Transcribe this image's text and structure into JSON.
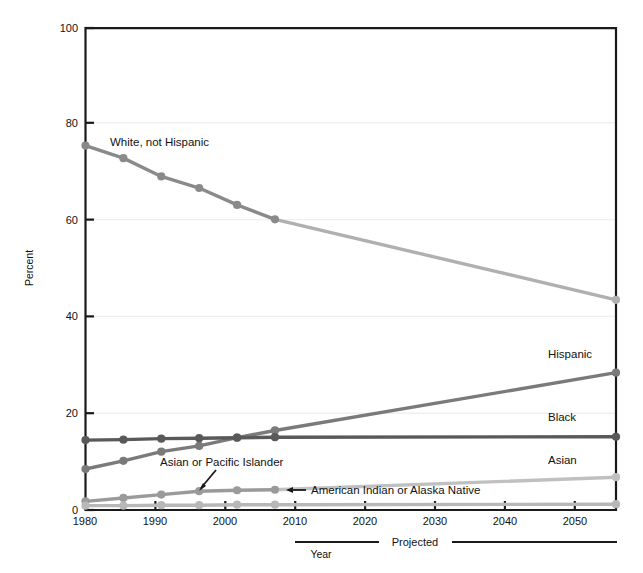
{
  "figure": {
    "title_cropped": "",
    "ylabel": "Percent",
    "xlabel": "Year",
    "projected_label": "Projected"
  },
  "axes": {
    "y_ticks": [
      "0",
      "20",
      "40",
      "60",
      "80",
      "100"
    ],
    "x_ticks": [
      "1980",
      "1990",
      "2000",
      "2010",
      "2020",
      "2030",
      "2040",
      "2050"
    ]
  },
  "annotations": {
    "white": "White, not Hispanic",
    "hispanic": "Hispanic",
    "black": "Black",
    "asian": "Asian",
    "asian_pacific": "Asian or Pacific Islander",
    "american_indian": "American Indian or Alaska Native"
  },
  "colors": {
    "white_not_hispanic": "#8a8a8a",
    "white_projected": "#b0b0b0",
    "hispanic": "#7a7a7a",
    "black": "#595959",
    "asian_pacific": "#9a9a9a",
    "asian_projected": "#c0c0c0",
    "american_indian": "#b8b8b8",
    "axis": "#1a1a1a",
    "grid": "#efefef"
  },
  "chart_data": {
    "type": "line",
    "title": "",
    "xlabel": "Year",
    "ylabel": "Percent",
    "xlim": [
      1980,
      2050
    ],
    "ylim": [
      0,
      100
    ],
    "grid": true,
    "legend": "inline-labels",
    "projected_from": 2007,
    "series": [
      {
        "name": "White, not Hispanic",
        "color": "#8a8a8a",
        "x": [
          1980,
          1985,
          1990,
          1995,
          2000,
          2005,
          2050
        ],
        "values": [
          75.6,
          73.0,
          69.2,
          66.8,
          63.3,
          60.3,
          43.6
        ]
      },
      {
        "name": "Hispanic",
        "color": "#7a7a7a",
        "x": [
          1980,
          1985,
          1990,
          1995,
          2000,
          2005,
          2050
        ],
        "values": [
          8.5,
          10.2,
          12.1,
          13.3,
          15.0,
          16.5,
          28.5
        ]
      },
      {
        "name": "Black",
        "color": "#595959",
        "x": [
          1980,
          1985,
          1990,
          1995,
          2000,
          2005,
          2050
        ],
        "values": [
          14.5,
          14.6,
          14.8,
          14.9,
          15.0,
          15.1,
          15.2
        ]
      },
      {
        "name": "Asian or Pacific Islander",
        "color": "#9a9a9a",
        "x": [
          1980,
          1985,
          1990,
          1995,
          2000,
          2005,
          2050
        ],
        "values": [
          1.8,
          2.5,
          3.2,
          3.9,
          4.1,
          4.2,
          6.8
        ]
      },
      {
        "name": "American Indian or Alaska Native",
        "color": "#b8b8b8",
        "x": [
          1980,
          1985,
          1990,
          1995,
          2000,
          2005,
          2050
        ],
        "values": [
          0.9,
          0.9,
          1.0,
          1.0,
          1.1,
          1.1,
          1.2
        ]
      }
    ]
  }
}
